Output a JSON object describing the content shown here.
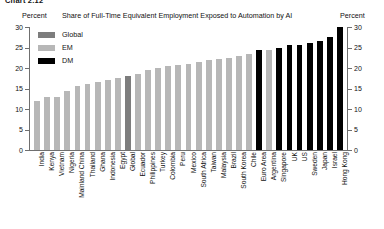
{
  "chart_number": "Chart 2.12",
  "header": {
    "left_unit": "Percent",
    "title": "Share of Full-Time Equivalent Employment Exposed to Automation by AI",
    "right_unit": "Percent"
  },
  "legend": {
    "position": "top-left",
    "items": [
      {
        "label": "Global",
        "color": "#7d7d7d",
        "key": "global"
      },
      {
        "label": "EM",
        "color": "#b7b7b7",
        "key": "em"
      },
      {
        "label": "DM",
        "color": "#000000",
        "key": "dm"
      }
    ]
  },
  "axes": {
    "y_ticks": [
      0,
      5,
      10,
      15,
      20,
      25,
      30
    ],
    "y_tick_labels": [
      "0",
      "5",
      "10",
      "15",
      "20",
      "25",
      "30"
    ],
    "ylim": [
      0,
      30
    ],
    "grid": false
  },
  "chart_data": {
    "type": "bar",
    "title": "Share of Full-Time Equivalent Employment Exposed to Automation by AI",
    "xlabel": "",
    "ylabel": "Percent",
    "ylim": [
      0,
      30
    ],
    "grid": false,
    "legend_position": "top-left",
    "categories": [
      "India",
      "Kenya",
      "Vietnam",
      "Nigeria",
      "Mainland China",
      "Thailand",
      "Ghana",
      "Indonesia",
      "Egypt",
      "Global",
      "Ecuador",
      "Philippines",
      "Turkey",
      "Colombia",
      "Peru",
      "Mexico",
      "South Africa",
      "Taiwan",
      "Malaysia",
      "Brazil",
      "South Korea",
      "Chile",
      "Euro Area",
      "Argentina",
      "Singapore",
      "UK",
      "US",
      "Sweden",
      "Japan",
      "Israel",
      "Hong Kong"
    ],
    "values": [
      12.0,
      13.0,
      13.0,
      14.5,
      15.5,
      16.0,
      16.5,
      17.0,
      17.5,
      18.0,
      18.5,
      19.5,
      20.0,
      20.5,
      20.8,
      21.0,
      21.5,
      22.0,
      22.3,
      22.5,
      23.0,
      23.3,
      24.5,
      24.5,
      25.0,
      25.5,
      25.7,
      26.0,
      26.5,
      27.5,
      30.0
    ],
    "groups": [
      "em",
      "em",
      "em",
      "em",
      "em",
      "em",
      "em",
      "em",
      "em",
      "global",
      "em",
      "em",
      "em",
      "em",
      "em",
      "em",
      "em",
      "em",
      "em",
      "em",
      "em",
      "em",
      "dm",
      "em",
      "dm",
      "dm",
      "dm",
      "dm",
      "dm",
      "dm",
      "dm"
    ],
    "series": [
      {
        "name": "Global",
        "color": "#7d7d7d"
      },
      {
        "name": "EM",
        "color": "#b7b7b7"
      },
      {
        "name": "DM",
        "color": "#000000"
      }
    ]
  }
}
